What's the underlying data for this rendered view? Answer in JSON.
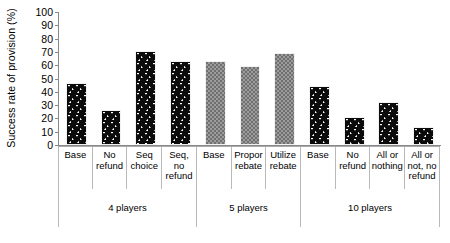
{
  "chart_data": {
    "type": "bar",
    "title": "",
    "xlabel": "",
    "ylabel": "Success rate of provision (%)",
    "ylim": [
      0,
      100
    ],
    "yticks": [
      0,
      10,
      20,
      30,
      40,
      50,
      60,
      70,
      80,
      90,
      100
    ],
    "grid": false,
    "legend": "none",
    "categories": [
      "Base",
      "No refund",
      "Seq choice",
      "Seq, no refund",
      "Base",
      "Propor rebate",
      "Utilize rebate",
      "Base",
      "No refund",
      "All or nothing",
      "All or not, no refund"
    ],
    "values": [
      47,
      26,
      70.5,
      63.5,
      63,
      59.5,
      69.5,
      44.5,
      21,
      32.5,
      13.5
    ],
    "bar_styles": [
      "dark-dotted",
      "dark-dotted",
      "dark-dotted",
      "dark-dotted",
      "grey-checker",
      "grey-checker",
      "grey-checker",
      "dark-dotted",
      "dark-dotted",
      "dark-dotted",
      "dark-dotted"
    ],
    "groups": [
      {
        "label": "4 players",
        "span": 4
      },
      {
        "label": "5 players",
        "span": 3
      },
      {
        "label": "10 players",
        "span": 4
      }
    ],
    "colors": {
      "dark_bar": "#0b0b0b",
      "grey_bar": "#6f6f6f",
      "axis": "#888888",
      "text": "#000000",
      "background": "#ffffff"
    }
  }
}
